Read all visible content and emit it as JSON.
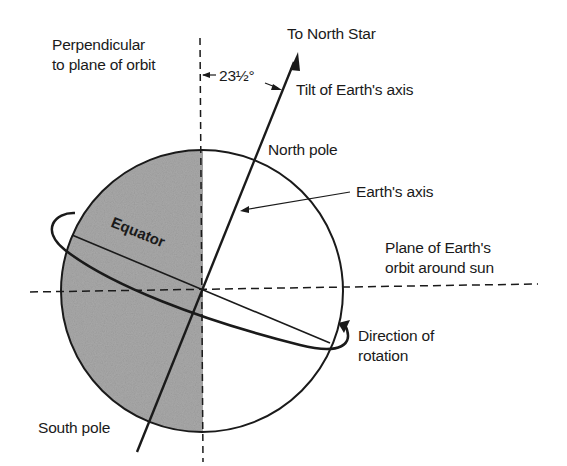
{
  "title": "Tilt of Earth's axis",
  "labels": {
    "perpendicular_line1": "Perpendicular",
    "perpendicular_line2": "to plane of orbit",
    "angle": "23½°",
    "north_star": "To North Star",
    "tilt": "Tilt of Earth's axis",
    "north_pole": "North pole",
    "earths_axis": "Earth's axis",
    "orbit_plane_line1": "Plane of Earth's",
    "orbit_plane_line2": "orbit around sun",
    "equator": "Equator",
    "rotation_line1": "Direction of",
    "rotation_line2": "rotation",
    "south_pole": "South pole"
  },
  "colors": {
    "line": "#1a1a1a",
    "shade": "#a9a9a9",
    "background": "#ffffff"
  },
  "geometry": {
    "axis_tilt_degrees": 23.5
  }
}
